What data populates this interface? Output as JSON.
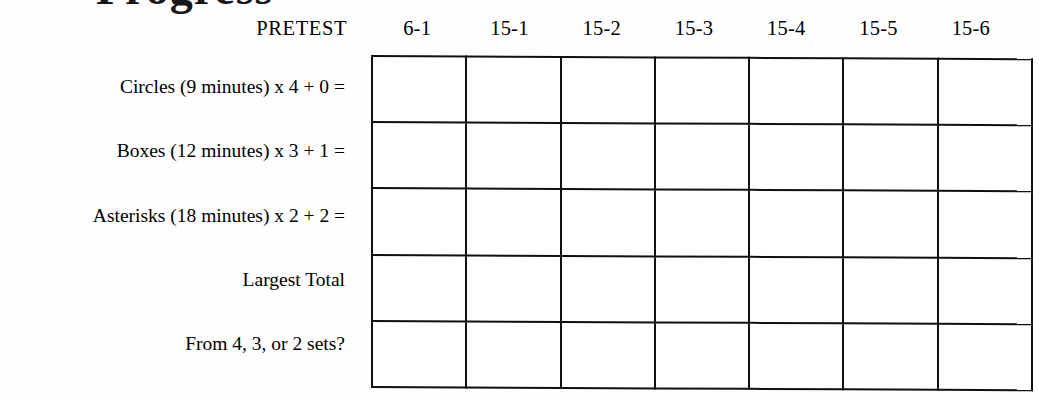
{
  "document": {
    "clipped_title_fragment": "Progress",
    "pretest_label": "PRETEST"
  },
  "table": {
    "column_headers": [
      "6-1",
      "15-1",
      "15-2",
      "15-3",
      "15-4",
      "15-5",
      "15-6"
    ],
    "row_labels": [
      "Circles (9 minutes) x 4 + 0 =",
      "Boxes (12 minutes) x 3 + 1 =",
      "Asterisks (18 minutes) x 2 + 2 =",
      "Largest Total",
      "From 4, 3, or 2 sets?"
    ],
    "cells": [
      [
        "",
        "",
        "",
        "",
        "",
        "",
        ""
      ],
      [
        "",
        "",
        "",
        "",
        "",
        "",
        ""
      ],
      [
        "",
        "",
        "",
        "",
        "",
        "",
        ""
      ],
      [
        "",
        "",
        "",
        "",
        "",
        "",
        ""
      ],
      [
        "",
        "",
        "",
        "",
        "",
        "",
        ""
      ]
    ],
    "rows": 5,
    "columns": 7
  },
  "colors": {
    "ink": "#101010",
    "paper": "#fefefe"
  }
}
